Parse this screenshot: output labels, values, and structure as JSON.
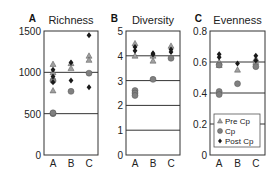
{
  "figure": {
    "legend": {
      "items": [
        {
          "label": "Pre Cp",
          "marker": "triangle",
          "color": "#a0a0a0"
        },
        {
          "label": "Cp",
          "marker": "circle",
          "color": "#808080"
        },
        {
          "label": "Post Cp",
          "marker": "diamond",
          "color": "#1a1a1a"
        }
      ]
    }
  },
  "chart_data": [
    {
      "type": "scatter",
      "panel_label": "A",
      "title": "Richness",
      "xlabel": "",
      "ylabel": "",
      "categories": [
        "A",
        "B",
        "C"
      ],
      "yticks": [
        0,
        500,
        1000,
        1500
      ],
      "ylim": [
        0,
        1500
      ],
      "gridlines": [
        500,
        1000
      ],
      "series": [
        {
          "name": "Pre Cp",
          "points": [
            [
              "A",
              1100
            ],
            [
              "A",
              1000
            ],
            [
              "A",
              920
            ],
            [
              "A",
              780
            ],
            [
              "B",
              1110
            ],
            [
              "B",
              1050
            ],
            [
              "C",
              1200
            ],
            [
              "C",
              1150
            ]
          ]
        },
        {
          "name": "Cp",
          "points": [
            [
              "A",
              500
            ],
            [
              "A",
              510
            ],
            [
              "A",
              900
            ],
            [
              "B",
              770
            ],
            [
              "C",
              990
            ]
          ]
        },
        {
          "name": "Post Cp",
          "points": [
            [
              "A",
              1030
            ],
            [
              "A",
              950
            ],
            [
              "A",
              880
            ],
            [
              "B",
              1120
            ],
            [
              "B",
              900
            ],
            [
              "C",
              1450
            ],
            [
              "C",
              820
            ]
          ]
        }
      ]
    },
    {
      "type": "scatter",
      "panel_label": "B",
      "title": "Diversity",
      "xlabel": "",
      "ylabel": "",
      "categories": [
        "A",
        "B",
        "C"
      ],
      "yticks": [
        0,
        1,
        2,
        3,
        4,
        5
      ],
      "ylim": [
        0,
        5
      ],
      "gridlines": [
        1,
        2,
        3,
        4
      ],
      "series": [
        {
          "name": "Pre Cp",
          "points": [
            [
              "A",
              4.5
            ],
            [
              "A",
              4.0
            ],
            [
              "B",
              3.8
            ],
            [
              "B",
              4.0
            ],
            [
              "C",
              4.4
            ]
          ]
        },
        {
          "name": "Cp",
          "points": [
            [
              "A",
              2.6
            ],
            [
              "A",
              2.5
            ],
            [
              "A",
              2.4
            ],
            [
              "B",
              3.05
            ],
            [
              "C",
              3.9
            ]
          ]
        },
        {
          "name": "Post Cp",
          "points": [
            [
              "A",
              4.35
            ],
            [
              "A",
              4.2
            ],
            [
              "B",
              4.1
            ],
            [
              "B",
              4.05
            ],
            [
              "C",
              4.25
            ],
            [
              "C",
              4.15
            ]
          ]
        }
      ]
    },
    {
      "type": "scatter",
      "panel_label": "C",
      "title": "Evenness",
      "xlabel": "",
      "ylabel": "",
      "categories": [
        "A",
        "B",
        "C"
      ],
      "yticks": [
        0,
        0.2,
        0.4,
        0.6,
        0.8
      ],
      "ylim": [
        0,
        0.8
      ],
      "gridlines": [
        0.2,
        0.4,
        0.6
      ],
      "legend_position": "lower right inside panel C",
      "series": [
        {
          "name": "Pre Cp",
          "points": [
            [
              "A",
              0.6
            ],
            [
              "A",
              0.58
            ],
            [
              "B",
              0.55
            ],
            [
              "C",
              0.62
            ],
            [
              "C",
              0.6
            ]
          ]
        },
        {
          "name": "Cp",
          "points": [
            [
              "A",
              0.41
            ],
            [
              "A",
              0.39
            ],
            [
              "A",
              0.58
            ],
            [
              "B",
              0.46
            ],
            [
              "C",
              0.57
            ]
          ]
        },
        {
          "name": "Post Cp",
          "points": [
            [
              "A",
              0.65
            ],
            [
              "A",
              0.63
            ],
            [
              "B",
              0.59
            ],
            [
              "C",
              0.64
            ],
            [
              "C",
              0.61
            ]
          ]
        }
      ]
    }
  ]
}
